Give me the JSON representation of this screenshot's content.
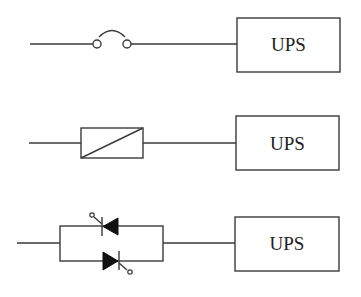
{
  "diagram": {
    "rows": [
      {
        "id": "fuse-switch",
        "component": "switch-contact",
        "load_label": "UPS"
      },
      {
        "id": "converter",
        "component": "converter-block",
        "load_label": "UPS"
      },
      {
        "id": "static-switch",
        "component": "antiparallel-thyristors",
        "load_label": "UPS"
      }
    ]
  },
  "colors": {
    "stroke": "#3a3a3a",
    "background": "#ffffff",
    "fill": "#111111"
  }
}
